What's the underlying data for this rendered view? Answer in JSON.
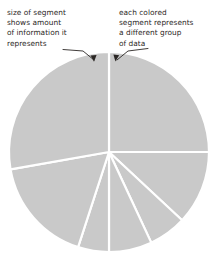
{
  "figure": {
    "background_color": "#ffffff"
  },
  "annotations": {
    "left": {
      "text": "size of segment\nshows amount\nof information it\nrepresents",
      "points_to": "top-left large segment",
      "arrow": "down-right-arrow"
    },
    "right": {
      "text": "each colored\nsegment represents\na different group\nof data",
      "points_to": "top-right segment",
      "arrow": "down-left-arrow"
    }
  },
  "chart_data": {
    "type": "pie",
    "title": "",
    "xlabel": "",
    "ylabel": "",
    "center": {
      "x": 109,
      "y": 152
    },
    "radius": 100,
    "start_angle_deg": 0,
    "direction": "clockwise",
    "legend": "none",
    "grid": false,
    "slice_fill": "#c9c9c9",
    "slice_stroke": "#ffffff",
    "stroke_width": 2.2,
    "categories": [
      "group 1",
      "group 2",
      "group 3",
      "group 4",
      "group 5",
      "group 6",
      "group 7"
    ],
    "values": [
      25,
      12,
      6,
      7,
      5,
      17,
      28
    ],
    "angles_deg": [
      90,
      43,
      22,
      25,
      18,
      62,
      100
    ],
    "percent_labels": [
      "25%",
      "12%",
      "6%",
      "7%",
      "5%",
      "17%",
      "28%"
    ]
  }
}
